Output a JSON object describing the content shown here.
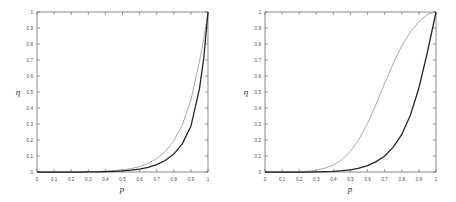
{
  "figure": {
    "background": "#ffffff",
    "panel_count": 2
  },
  "chart_data": [
    {
      "type": "line",
      "panel": "left",
      "title": "",
      "xlabel": "p",
      "ylabel": "η",
      "xlim": [
        0,
        1
      ],
      "ylim": [
        0,
        1
      ],
      "grid": false,
      "legend": "none",
      "xticks": [
        0,
        0.1,
        0.2,
        0.3,
        0.4,
        0.5,
        0.6,
        0.7,
        0.8,
        0.9,
        1
      ],
      "xticklabels": [
        "0",
        "0.1",
        "0.2",
        "0.3",
        "0.4",
        "0.5",
        "0.6",
        "0.7",
        "0.8",
        "0.9",
        "1"
      ],
      "yticks": [
        0,
        0.1,
        0.2,
        0.3,
        0.4,
        0.5,
        0.6,
        0.7,
        0.8,
        0.9,
        1
      ],
      "yticklabels": [
        "0",
        "0.1",
        "0.2",
        "0.3",
        "0.4",
        "0.5",
        "0.6",
        "0.7",
        "0.8",
        "0.9",
        "1"
      ],
      "x": [
        0,
        0.05,
        0.1,
        0.15,
        0.2,
        0.25,
        0.3,
        0.35,
        0.4,
        0.45,
        0.5,
        0.55,
        0.6,
        0.65,
        0.7,
        0.75,
        0.8,
        0.85,
        0.9,
        0.95,
        0.975,
        1
      ],
      "series": [
        {
          "name": "upper-curve",
          "color": "#8c8c8c",
          "linewidth": 0.75,
          "values": [
            0,
            0,
            0,
            0,
            0,
            0.001,
            0.002,
            0.003,
            0.005,
            0.008,
            0.013,
            0.021,
            0.034,
            0.054,
            0.084,
            0.128,
            0.195,
            0.295,
            0.45,
            0.69,
            0.83,
            1
          ]
        },
        {
          "name": "lower-curve",
          "color": "#222222",
          "linewidth": 1.25,
          "values": [
            0,
            0,
            0,
            0,
            0,
            0,
            0.001,
            0.001,
            0.002,
            0.004,
            0.007,
            0.011,
            0.018,
            0.029,
            0.046,
            0.072,
            0.112,
            0.176,
            0.285,
            0.52,
            0.71,
            1
          ]
        }
      ]
    },
    {
      "type": "line",
      "panel": "right",
      "title": "",
      "xlabel": "p",
      "ylabel": "η",
      "xlim": [
        0,
        1
      ],
      "ylim": [
        0,
        1
      ],
      "grid": false,
      "legend": "none",
      "xticks": [
        0,
        0.1,
        0.2,
        0.3,
        0.4,
        0.5,
        0.6,
        0.7,
        0.8,
        0.9,
        1
      ],
      "xticklabels": [
        "0",
        "0.1",
        "0.2",
        "0.3",
        "0.4",
        "0.5",
        "0.6",
        "0.7",
        "0.8",
        "0.9",
        "1"
      ],
      "yticks": [
        0,
        0.1,
        0.2,
        0.3,
        0.4,
        0.5,
        0.6,
        0.7,
        0.8,
        0.9,
        1
      ],
      "yticklabels": [
        "0",
        "0.1",
        "0.2",
        "0.3",
        "0.4",
        "0.5",
        "0.6",
        "0.7",
        "0.8",
        "0.9",
        "1"
      ],
      "x": [
        0,
        0.05,
        0.1,
        0.15,
        0.2,
        0.25,
        0.3,
        0.35,
        0.4,
        0.45,
        0.5,
        0.55,
        0.6,
        0.65,
        0.7,
        0.75,
        0.8,
        0.85,
        0.9,
        0.95,
        1
      ],
      "series": [
        {
          "name": "upper-curve",
          "color": "#8c8c8c",
          "linewidth": 0.75,
          "values": [
            0,
            0,
            0,
            0,
            0.002,
            0.005,
            0.011,
            0.023,
            0.044,
            0.078,
            0.13,
            0.205,
            0.305,
            0.425,
            0.555,
            0.68,
            0.79,
            0.875,
            0.94,
            0.985,
            1
          ]
        },
        {
          "name": "lower-curve",
          "color": "#222222",
          "linewidth": 1.25,
          "values": [
            0,
            0,
            0,
            0,
            0,
            0,
            0.001,
            0.002,
            0.004,
            0.008,
            0.014,
            0.024,
            0.04,
            0.065,
            0.1,
            0.155,
            0.235,
            0.355,
            0.525,
            0.75,
            1
          ]
        }
      ]
    }
  ]
}
